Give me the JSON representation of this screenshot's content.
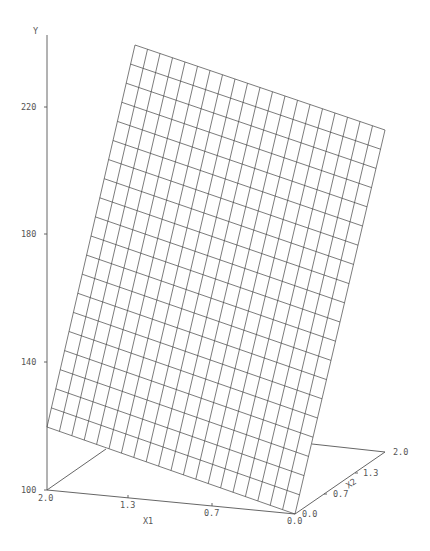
{
  "chart_data": {
    "type": "surface3d",
    "title": "",
    "style": "wireframe",
    "axes": {
      "y": {
        "label": "Y",
        "ticks": [
          "100",
          "140",
          "180",
          "220"
        ],
        "range": [
          100,
          240
        ]
      },
      "x1": {
        "label": "X1",
        "ticks": [
          "2.0",
          "1.3",
          "0.7",
          "0.0"
        ],
        "range": [
          0.0,
          2.0
        ]
      },
      "x2": {
        "label": "X2",
        "ticks": [
          "0.0",
          "0.7",
          "1.3",
          "2.0"
        ],
        "range": [
          0.0,
          2.0
        ]
      }
    },
    "grid": {
      "rows": 20,
      "cols": 20
    },
    "surface_corners": [
      {
        "x1": 2.0,
        "x2": 0.0,
        "y": 110
      },
      {
        "x1": 0.0,
        "x2": 0.0,
        "y": 100
      },
      {
        "x1": 0.0,
        "x2": 2.0,
        "y": 213
      },
      {
        "x1": 2.0,
        "x2": 2.0,
        "y": 237
      }
    ],
    "line_color": "#444444"
  },
  "labels": {
    "y_axis": "Y",
    "y_220": "220",
    "y_180": "180",
    "y_140": "140",
    "y_100": "100",
    "x1_axis": "X1",
    "x1_20": "2.0",
    "x1_13": "1.3",
    "x1_07": "0.7",
    "x1_00": "0.0",
    "x2_axis": "X2",
    "x2_00": "0.0",
    "x2_07": "0.7",
    "x2_13": "1.3",
    "x2_20": "2.0"
  }
}
